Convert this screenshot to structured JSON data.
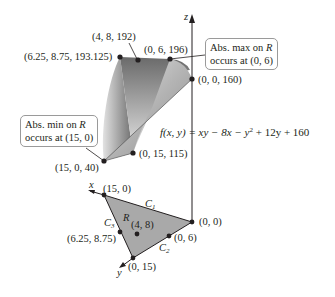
{
  "figure": {
    "formula": {
      "lhs": "f(x, y) = ",
      "rhs_text": "xy − 8x − y",
      "exp": "2",
      "rhs_tail": " + 12y + 160"
    },
    "axes": {
      "z": "z",
      "x": "x",
      "y": "y"
    },
    "surface_points": [
      {
        "id": "p1",
        "label": "(6.25, 8.75, 193.125)"
      },
      {
        "id": "p2",
        "label": "(4, 8, 192)"
      },
      {
        "id": "p3",
        "label": "(0, 6, 196)"
      },
      {
        "id": "p4",
        "label": "(0, 0, 160)"
      },
      {
        "id": "p5",
        "label": "(15, 0, 40)"
      },
      {
        "id": "p6",
        "label": "(0, 15, 115)"
      }
    ],
    "region_points": [
      {
        "id": "r1",
        "label": "(15, 0)"
      },
      {
        "id": "r2",
        "label": "(0, 0)"
      },
      {
        "id": "r3",
        "label": "(0, 6)"
      },
      {
        "id": "r4",
        "label": "(0, 15)"
      },
      {
        "id": "r5",
        "label": "(6.25, 8.75)"
      },
      {
        "id": "r6",
        "label": "(4, 8)"
      }
    ],
    "region_label": "R",
    "curves": [
      {
        "name": "C",
        "sub": "1"
      },
      {
        "name": "C",
        "sub": "2"
      },
      {
        "name": "C",
        "sub": "3"
      }
    ],
    "callouts": {
      "max": {
        "line1_prefix": "Abs. max on ",
        "line1_var": "R",
        "line2": "occurs at (0, 6)"
      },
      "min": {
        "line1_prefix": "Abs. min on ",
        "line1_var": "R",
        "line2": "occurs at (15, 0)"
      }
    },
    "colors": {
      "surface_dark": "#6f6f6f",
      "surface_light": "#d8d8d8",
      "region_fill": "#a9a9a9",
      "line": "#231f20"
    }
  }
}
